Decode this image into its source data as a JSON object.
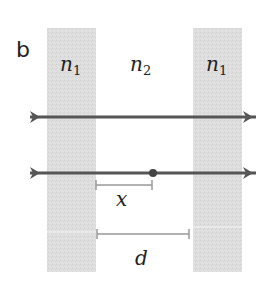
{
  "panel_label": "b",
  "regions": [
    {
      "label_base": "n",
      "label_sub": "1",
      "type": "slab"
    },
    {
      "label_base": "n",
      "label_sub": "2",
      "type": "gap"
    },
    {
      "label_base": "n",
      "label_sub": "1",
      "type": "slab"
    }
  ],
  "rays": [
    {
      "name": "ray-top",
      "direction": "right"
    },
    {
      "name": "ray-bottom",
      "direction": "right",
      "marker": "point"
    }
  ],
  "dimensions": [
    {
      "label": "x",
      "meaning": "distance from left slab to point"
    },
    {
      "label": "d",
      "meaning": "gap width between slabs"
    }
  ],
  "colors": {
    "slab": "#dcdcdc",
    "ray": "#555555",
    "dimension": "#999999",
    "text": "#222222"
  }
}
